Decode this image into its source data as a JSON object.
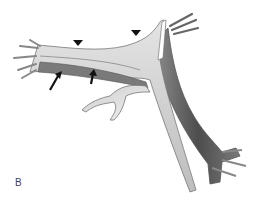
{
  "figure": {
    "panel_label": "B",
    "colors": {
      "background": "#ffffff",
      "light_structure": "#d6d6d6",
      "mid_structure": "#a8a8a8",
      "dark_structure": "#555555",
      "outline": "#6a6a6a",
      "marker": "#111111"
    },
    "annotations": {
      "arrowheads": [
        {
          "name": "arrowhead-1",
          "x": 78,
          "y": 43
        },
        {
          "name": "arrowhead-2",
          "x": 136,
          "y": 33
        }
      ],
      "arrows": [
        {
          "name": "arrow-1",
          "from": [
            50,
            90
          ],
          "to": [
            59,
            74
          ]
        },
        {
          "name": "arrow-2",
          "from": [
            91,
            84
          ],
          "to": [
            93,
            71
          ]
        }
      ]
    }
  }
}
